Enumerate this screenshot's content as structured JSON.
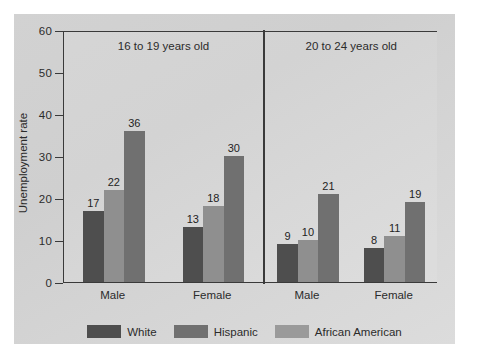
{
  "chart_data": {
    "type": "bar",
    "title": "",
    "xlabel": "",
    "ylabel": "Unemployment rate",
    "ylim": [
      0,
      60
    ],
    "yticks": [
      0,
      10,
      20,
      30,
      40,
      50,
      60
    ],
    "grid": false,
    "legend_position": "bottom",
    "panels": [
      {
        "title": "16 to 19 years old",
        "categories": [
          "Male",
          "Female"
        ],
        "series": [
          {
            "name": "White",
            "values": [
              17,
              13
            ]
          },
          {
            "name": "Hispanic",
            "values": [
              22,
              18
            ]
          },
          {
            "name": "African American",
            "values": [
              36,
              30
            ]
          }
        ]
      },
      {
        "title": "20 to 24 years old",
        "categories": [
          "Male",
          "Female"
        ],
        "series": [
          {
            "name": "White",
            "values": [
              9,
              8
            ]
          },
          {
            "name": "Hispanic",
            "values": [
              10,
              11
            ]
          },
          {
            "name": "African American",
            "values": [
              21,
              19
            ]
          }
        ]
      }
    ],
    "series_colors": {
      "White": "#4e4e4e",
      "Hispanic": "#8f8f8f",
      "African American": "#707070"
    },
    "legend": [
      {
        "label": "White",
        "color": "#4e4e4e"
      },
      {
        "label": "Hispanic",
        "color": "#707070"
      },
      {
        "label": "African American",
        "color": "#9a9a9a"
      }
    ]
  },
  "axis": {
    "y_tick_labels": [
      "0",
      "10",
      "20",
      "30",
      "40",
      "50",
      "60"
    ],
    "y_title": "Unemployment rate"
  }
}
